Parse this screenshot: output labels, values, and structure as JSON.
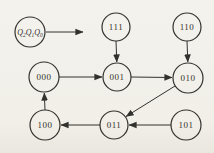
{
  "figure": {
    "background": "#f1efe8",
    "line_color": "#33312e",
    "text_color": "#33312e",
    "node_fill": "transparent"
  },
  "diagram": {
    "type": "state-diagram",
    "register_label": {
      "text": "Q2Q1Q0",
      "parts": [
        {
          "t": "Q",
          "sub": false
        },
        {
          "t": "2",
          "sub": true
        },
        {
          "t": "Q",
          "sub": false
        },
        {
          "t": "1",
          "sub": true
        },
        {
          "t": "Q",
          "sub": false
        },
        {
          "t": "0",
          "sub": true
        }
      ],
      "x": 30,
      "y": 32,
      "r": 15,
      "pointer": {
        "x1": 46,
        "y1": 32,
        "x2": 83,
        "y2": 32
      }
    },
    "nodes": [
      {
        "id": "111",
        "label": "111",
        "x": 116,
        "y": 27,
        "r": 14
      },
      {
        "id": "110",
        "label": "110",
        "x": 187,
        "y": 27,
        "r": 14
      },
      {
        "id": "000",
        "label": "000",
        "x": 44,
        "y": 77,
        "r": 15
      },
      {
        "id": "001",
        "label": "001",
        "x": 117,
        "y": 77,
        "r": 14
      },
      {
        "id": "010",
        "label": "010",
        "x": 188,
        "y": 78,
        "r": 15
      },
      {
        "id": "100",
        "label": "100",
        "x": 45,
        "y": 125,
        "r": 15
      },
      {
        "id": "011",
        "label": "011",
        "x": 114,
        "y": 125,
        "r": 14
      },
      {
        "id": "101",
        "label": "101",
        "x": 186,
        "y": 125,
        "r": 15
      }
    ],
    "transitions": [
      {
        "from": "111",
        "to": "001",
        "x1": 116,
        "y1": 41,
        "x2": 116.8,
        "y2": 62
      },
      {
        "from": "110",
        "to": "010",
        "x1": 187,
        "y1": 41,
        "x2": 187.8,
        "y2": 62
      },
      {
        "from": "000",
        "to": "001",
        "x1": 59,
        "y1": 77,
        "x2": 102,
        "y2": 77
      },
      {
        "from": "001",
        "to": "010",
        "x1": 131,
        "y1": 77,
        "x2": 172,
        "y2": 77.5
      },
      {
        "from": "010",
        "to": "011",
        "x1": 175,
        "y1": 86,
        "x2": 126,
        "y2": 116.5
      },
      {
        "from": "101",
        "to": "011",
        "x1": 171,
        "y1": 125,
        "x2": 129,
        "y2": 125
      },
      {
        "from": "011",
        "to": "100",
        "x1": 100,
        "y1": 125,
        "x2": 61,
        "y2": 125
      },
      {
        "from": "100",
        "to": "000",
        "x1": 45,
        "y1": 110,
        "x2": 44.3,
        "y2": 93
      }
    ]
  }
}
